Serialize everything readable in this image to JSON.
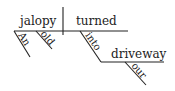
{
  "diagram": {
    "type": "sentence-diagram",
    "sentence": "An old jalopy turned into our driveway",
    "subject": "jalopy",
    "verb": "turned",
    "subject_modifiers": [
      "An",
      "old"
    ],
    "preposition": "into",
    "prep_object": "driveway",
    "object_modifier": "our",
    "line_color": "#222222"
  }
}
